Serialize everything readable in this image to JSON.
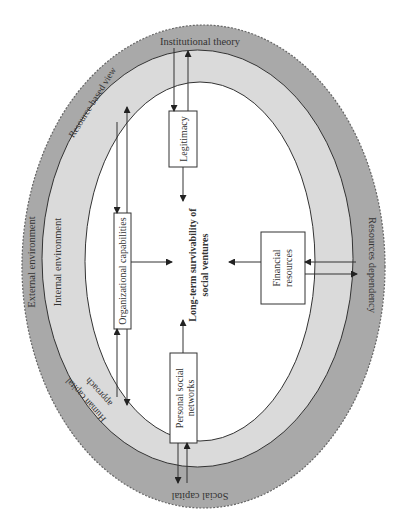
{
  "diagram": {
    "center": "Long-term survivability of social ventures",
    "center_lines": [
      "Long-term survivability of",
      "social ventures"
    ],
    "rings": {
      "outer": "External environment",
      "inner": "Internal environment"
    },
    "theories": {
      "top": "Institutional theory",
      "left_upper": "Resource-based view",
      "left_lower_1": "Human capital",
      "left_lower_2": "approach",
      "right": "Resources dependency",
      "bottom": "Social capital"
    },
    "boxes": {
      "legitimacy": "Legitimacy",
      "organizational": "Organizational capabilities",
      "financial_1": "Financial",
      "financial_2": "resources",
      "personal_1": "Personal social",
      "personal_2": "networks"
    },
    "colors": {
      "outer_band": "#a9a9a9",
      "inner_band": "#d9d9d9",
      "core": "#ffffff",
      "stroke": "#333333"
    }
  }
}
